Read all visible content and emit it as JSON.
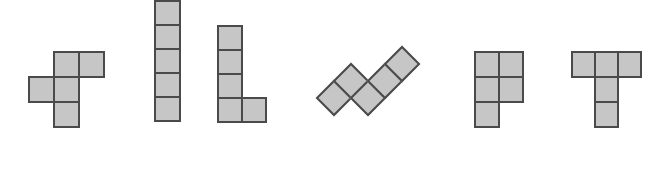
{
  "figure": {
    "background_color": "#ffffff",
    "square_fill_color": "#c6c6c6",
    "square_border_color": "#4a4a4a",
    "square_border_width": 2,
    "shapes": [
      {
        "name": "f-pentomino",
        "kind": "grid",
        "origin": {
          "x": 29,
          "y": 52
        },
        "cell": {
          "w": 25,
          "h": 25
        },
        "cells": [
          [
            1,
            0
          ],
          [
            2,
            0
          ],
          [
            0,
            1
          ],
          [
            1,
            1
          ],
          [
            1,
            2
          ]
        ]
      },
      {
        "name": "i-pentomino",
        "kind": "grid",
        "origin": {
          "x": 155,
          "y": 1
        },
        "cell": {
          "w": 25,
          "h": 24
        },
        "cells": [
          [
            0,
            0
          ],
          [
            0,
            1
          ],
          [
            0,
            2
          ],
          [
            0,
            3
          ],
          [
            0,
            4
          ]
        ]
      },
      {
        "name": "l-pentomino",
        "kind": "grid",
        "origin": {
          "x": 218,
          "y": 26
        },
        "cell": {
          "w": 24,
          "h": 24
        },
        "cells": [
          [
            0,
            0
          ],
          [
            0,
            1
          ],
          [
            0,
            2
          ],
          [
            0,
            3
          ],
          [
            1,
            3
          ]
        ]
      },
      {
        "name": "n-pentomino-diagonal",
        "kind": "diamond",
        "origin": {
          "x": 334,
          "y": 98
        },
        "halfStep": 17,
        "side": 24,
        "cells": [
          [
            0,
            0
          ],
          [
            1,
            0
          ],
          [
            1,
            1
          ],
          [
            2,
            1
          ],
          [
            3,
            1
          ]
        ]
      },
      {
        "name": "p-pentomino",
        "kind": "grid",
        "origin": {
          "x": 475,
          "y": 52
        },
        "cell": {
          "w": 24,
          "h": 25
        },
        "cells": [
          [
            0,
            0
          ],
          [
            1,
            0
          ],
          [
            0,
            1
          ],
          [
            1,
            1
          ],
          [
            0,
            2
          ]
        ]
      },
      {
        "name": "t-pentomino",
        "kind": "grid",
        "origin": {
          "x": 572,
          "y": 52
        },
        "cell": {
          "w": 23,
          "h": 25
        },
        "cells": [
          [
            0,
            0
          ],
          [
            1,
            0
          ],
          [
            2,
            0
          ],
          [
            1,
            1
          ],
          [
            1,
            2
          ]
        ]
      }
    ]
  }
}
